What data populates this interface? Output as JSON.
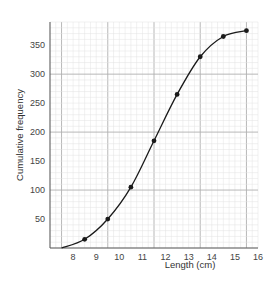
{
  "chart_data": {
    "type": "line",
    "title": "",
    "xlabel": "Length (cm)",
    "ylabel": "Cumulative frequency",
    "xlim": [
      7,
      16
    ],
    "ylim": [
      0,
      390
    ],
    "x_ticks": [
      8,
      9,
      10,
      11,
      12,
      13,
      14,
      15,
      16
    ],
    "y_ticks": [
      50,
      100,
      150,
      200,
      250,
      300,
      350
    ],
    "grid": true,
    "legend": null,
    "curve_start": [
      7.5,
      0
    ],
    "x": [
      8.5,
      9.5,
      10.5,
      11.5,
      12.5,
      13.5,
      14.5,
      15.5
    ],
    "values": [
      15,
      50,
      105,
      185,
      265,
      330,
      365,
      375
    ],
    "colors": {
      "line": "#1a1a1a",
      "grid_minor": "#e2e2e2",
      "grid_major": "#b0b0b0",
      "axis": "#555555"
    }
  }
}
